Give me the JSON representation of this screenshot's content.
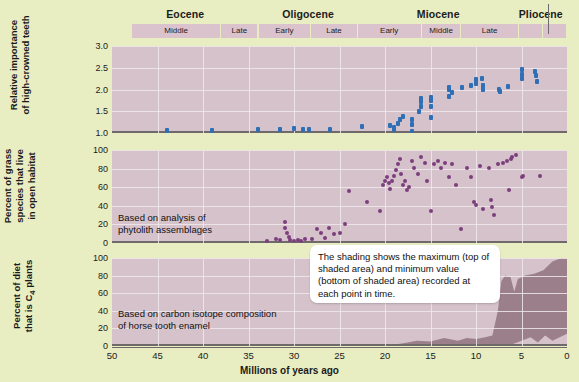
{
  "figure": {
    "background_color": "#e9edc2",
    "panel_color": "#d6c2ca",
    "gridline_color": "#efe9ec",
    "blue_marker_color": "#2f6fb5",
    "purple_marker_color": "#7b3f7e",
    "shading_color": "#9b7f8b"
  },
  "timescale": {
    "epochs": [
      {
        "label": "Eocene",
        "start_ma": 50,
        "end_ma": 33.9
      },
      {
        "label": "Oligocene",
        "start_ma": 33.9,
        "end_ma": 23.0
      },
      {
        "label": "Miocene",
        "start_ma": 23.0,
        "end_ma": 5.3
      },
      {
        "label": "Pliocene",
        "start_ma": 5.3,
        "end_ma": 2.6
      }
    ],
    "stages": [
      {
        "label": "Middle",
        "start_ma": 47.8,
        "end_ma": 38.0
      },
      {
        "label": "Late",
        "start_ma": 38.0,
        "end_ma": 33.9
      },
      {
        "label": "Early",
        "start_ma": 33.9,
        "end_ma": 28.1
      },
      {
        "label": "Late",
        "start_ma": 28.1,
        "end_ma": 23.0
      },
      {
        "label": "Early",
        "start_ma": 23.0,
        "end_ma": 15.97
      },
      {
        "label": "Middle",
        "start_ma": 15.97,
        "end_ma": 11.6
      },
      {
        "label": "Late",
        "start_ma": 11.6,
        "end_ma": 5.3
      },
      {
        "label": "",
        "start_ma": 5.3,
        "end_ma": 2.6
      },
      {
        "label": "",
        "start_ma": 2.6,
        "end_ma": 0
      }
    ]
  },
  "xaxis": {
    "title": "Millions of years ago",
    "ticks": [
      50,
      45,
      40,
      35,
      30,
      25,
      20,
      15,
      10,
      5,
      0
    ],
    "min": 0,
    "max": 50,
    "reversed": true
  },
  "chart_data": [
    {
      "type": "scatter",
      "panel": 1,
      "title": "",
      "ylabel": "Relative importance of high-crowned teeth",
      "xlabel": "Millions of years ago",
      "ylim": [
        1.0,
        3.0
      ],
      "yticks": [
        1.0,
        1.5,
        2.0,
        2.5,
        3.0
      ],
      "ytick_labels": [
        "1.0",
        "1.5",
        "2.0",
        "2.5",
        "3.0"
      ],
      "marker_color": "#2f6fb5",
      "points": [
        {
          "x": 44.0,
          "y": 1.05
        },
        {
          "x": 39.0,
          "y": 1.06
        },
        {
          "x": 34.0,
          "y": 1.07
        },
        {
          "x": 31.5,
          "y": 1.09
        },
        {
          "x": 30.0,
          "y": 1.1
        },
        {
          "x": 29.0,
          "y": 1.08
        },
        {
          "x": 28.3,
          "y": 1.09
        },
        {
          "x": 26.0,
          "y": 1.08
        },
        {
          "x": 22.5,
          "y": 1.16
        },
        {
          "x": 19.5,
          "y": 1.18
        },
        {
          "x": 19.0,
          "y": 1.12
        },
        {
          "x": 19.0,
          "y": 1.08
        },
        {
          "x": 18.6,
          "y": 1.22
        },
        {
          "x": 18.3,
          "y": 1.3
        },
        {
          "x": 18.0,
          "y": 1.38
        },
        {
          "x": 17.0,
          "y": 1.04
        },
        {
          "x": 17.0,
          "y": 1.2
        },
        {
          "x": 17.0,
          "y": 1.32
        },
        {
          "x": 16.3,
          "y": 1.5
        },
        {
          "x": 16.0,
          "y": 1.62
        },
        {
          "x": 16.0,
          "y": 1.72
        },
        {
          "x": 16.0,
          "y": 1.8
        },
        {
          "x": 15.0,
          "y": 1.35
        },
        {
          "x": 15.0,
          "y": 1.6
        },
        {
          "x": 15.0,
          "y": 1.74
        },
        {
          "x": 14.9,
          "y": 1.82
        },
        {
          "x": 13.0,
          "y": 1.85
        },
        {
          "x": 13.0,
          "y": 2.0
        },
        {
          "x": 13.0,
          "y": 2.05
        },
        {
          "x": 12.6,
          "y": 1.92
        },
        {
          "x": 11.5,
          "y": 2.05
        },
        {
          "x": 10.5,
          "y": 2.1
        },
        {
          "x": 10.0,
          "y": 2.22
        },
        {
          "x": 10.0,
          "y": 2.14
        },
        {
          "x": 9.3,
          "y": 2.25
        },
        {
          "x": 9.2,
          "y": 2.1
        },
        {
          "x": 9.2,
          "y": 2.0
        },
        {
          "x": 7.5,
          "y": 2.0
        },
        {
          "x": 7.4,
          "y": 1.96
        },
        {
          "x": 6.5,
          "y": 2.06
        },
        {
          "x": 5.0,
          "y": 2.45
        },
        {
          "x": 5.0,
          "y": 2.35
        },
        {
          "x": 5.0,
          "y": 2.25
        },
        {
          "x": 3.5,
          "y": 2.42
        },
        {
          "x": 3.4,
          "y": 2.32
        },
        {
          "x": 3.3,
          "y": 2.18
        }
      ]
    },
    {
      "type": "scatter",
      "panel": 2,
      "title": "",
      "ylabel": "Percent of grass species that live in open habitat",
      "xlabel": "Millions of years ago",
      "ylim": [
        0,
        100
      ],
      "yticks": [
        0,
        20,
        40,
        60,
        80,
        100
      ],
      "ytick_labels": [
        "0",
        "20",
        "40",
        "60",
        "80",
        "100"
      ],
      "marker_color": "#7b3f7e",
      "annotation": "Based on analysis of\nphytolith assemblages",
      "points": [
        {
          "x": 33.0,
          "y": 2
        },
        {
          "x": 32.0,
          "y": 4
        },
        {
          "x": 31.5,
          "y": 3
        },
        {
          "x": 31.0,
          "y": 22
        },
        {
          "x": 31.0,
          "y": 16
        },
        {
          "x": 30.8,
          "y": 10
        },
        {
          "x": 30.6,
          "y": 6
        },
        {
          "x": 30.4,
          "y": 3
        },
        {
          "x": 30.0,
          "y": 2
        },
        {
          "x": 29.6,
          "y": 3
        },
        {
          "x": 29.2,
          "y": 2
        },
        {
          "x": 28.8,
          "y": 4
        },
        {
          "x": 28.0,
          "y": 4
        },
        {
          "x": 27.5,
          "y": 14
        },
        {
          "x": 27.0,
          "y": 10
        },
        {
          "x": 26.6,
          "y": 5
        },
        {
          "x": 26.2,
          "y": 16
        },
        {
          "x": 25.6,
          "y": 9
        },
        {
          "x": 25.0,
          "y": 10
        },
        {
          "x": 24.4,
          "y": 20
        },
        {
          "x": 24.0,
          "y": 55
        },
        {
          "x": 22.0,
          "y": 44
        },
        {
          "x": 20.5,
          "y": 34
        },
        {
          "x": 20.2,
          "y": 62
        },
        {
          "x": 20.0,
          "y": 66
        },
        {
          "x": 19.8,
          "y": 70
        },
        {
          "x": 19.6,
          "y": 64
        },
        {
          "x": 19.4,
          "y": 58
        },
        {
          "x": 19.2,
          "y": 66
        },
        {
          "x": 19.0,
          "y": 72
        },
        {
          "x": 18.8,
          "y": 78
        },
        {
          "x": 18.6,
          "y": 84
        },
        {
          "x": 18.4,
          "y": 90
        },
        {
          "x": 18.2,
          "y": 74
        },
        {
          "x": 18.0,
          "y": 62
        },
        {
          "x": 17.8,
          "y": 66
        },
        {
          "x": 17.6,
          "y": 56
        },
        {
          "x": 17.4,
          "y": 60
        },
        {
          "x": 17.0,
          "y": 88
        },
        {
          "x": 16.8,
          "y": 80
        },
        {
          "x": 16.4,
          "y": 74
        },
        {
          "x": 16.0,
          "y": 92
        },
        {
          "x": 15.6,
          "y": 86
        },
        {
          "x": 15.4,
          "y": 66
        },
        {
          "x": 15.0,
          "y": 34
        },
        {
          "x": 14.6,
          "y": 84
        },
        {
          "x": 14.2,
          "y": 88
        },
        {
          "x": 13.8,
          "y": 80
        },
        {
          "x": 13.4,
          "y": 86
        },
        {
          "x": 13.0,
          "y": 70
        },
        {
          "x": 12.6,
          "y": 84
        },
        {
          "x": 12.2,
          "y": 62
        },
        {
          "x": 11.6,
          "y": 14
        },
        {
          "x": 11.0,
          "y": 80
        },
        {
          "x": 10.6,
          "y": 70
        },
        {
          "x": 10.2,
          "y": 44
        },
        {
          "x": 10.0,
          "y": 40
        },
        {
          "x": 9.6,
          "y": 82
        },
        {
          "x": 9.2,
          "y": 36
        },
        {
          "x": 8.6,
          "y": 80
        },
        {
          "x": 8.4,
          "y": 46
        },
        {
          "x": 8.2,
          "y": 38
        },
        {
          "x": 8.0,
          "y": 30
        },
        {
          "x": 7.6,
          "y": 84
        },
        {
          "x": 7.0,
          "y": 86
        },
        {
          "x": 6.6,
          "y": 88
        },
        {
          "x": 6.4,
          "y": 56
        },
        {
          "x": 6.2,
          "y": 90
        },
        {
          "x": 6.0,
          "y": 92
        },
        {
          "x": 5.6,
          "y": 94
        },
        {
          "x": 5.0,
          "y": 70
        },
        {
          "x": 4.8,
          "y": 72
        },
        {
          "x": 3.0,
          "y": 72
        }
      ]
    },
    {
      "type": "area",
      "panel": 3,
      "title": "",
      "ylabel": "Percent of diet that is C4 plants",
      "xlabel": "Millions of years ago",
      "ylim": [
        0,
        100
      ],
      "yticks": [
        0,
        20,
        40,
        60,
        80,
        100
      ],
      "ytick_labels": [
        "0",
        "20",
        "40",
        "60",
        "80",
        "100"
      ],
      "fill_color": "#9b7f8b",
      "annotation": "Based on carbon isotope composition\nof horse tooth enamel",
      "band_max": [
        {
          "x": 20.0,
          "y": 0
        },
        {
          "x": 18.0,
          "y": 3
        },
        {
          "x": 16.5,
          "y": 6
        },
        {
          "x": 15.0,
          "y": 5
        },
        {
          "x": 13.5,
          "y": 9
        },
        {
          "x": 12.0,
          "y": 6
        },
        {
          "x": 11.0,
          "y": 9
        },
        {
          "x": 10.0,
          "y": 8
        },
        {
          "x": 9.0,
          "y": 10
        },
        {
          "x": 8.2,
          "y": 12
        },
        {
          "x": 7.6,
          "y": 40
        },
        {
          "x": 7.2,
          "y": 74
        },
        {
          "x": 6.8,
          "y": 80
        },
        {
          "x": 6.2,
          "y": 78
        },
        {
          "x": 5.8,
          "y": 62
        },
        {
          "x": 5.4,
          "y": 76
        },
        {
          "x": 4.6,
          "y": 80
        },
        {
          "x": 3.6,
          "y": 82
        },
        {
          "x": 2.6,
          "y": 86
        },
        {
          "x": 1.6,
          "y": 96
        },
        {
          "x": 0.6,
          "y": 100
        },
        {
          "x": 0.0,
          "y": 100
        }
      ],
      "band_min": [
        {
          "x": 20.0,
          "y": 0
        },
        {
          "x": 16.0,
          "y": 0
        },
        {
          "x": 12.0,
          "y": 0
        },
        {
          "x": 9.0,
          "y": 0
        },
        {
          "x": 7.5,
          "y": 0
        },
        {
          "x": 6.0,
          "y": 2
        },
        {
          "x": 5.0,
          "y": 6
        },
        {
          "x": 4.0,
          "y": 10
        },
        {
          "x": 3.2,
          "y": 4
        },
        {
          "x": 2.4,
          "y": 12
        },
        {
          "x": 1.6,
          "y": 6
        },
        {
          "x": 0.8,
          "y": 10
        },
        {
          "x": 0.0,
          "y": 14
        }
      ]
    }
  ],
  "callout": {
    "text": "The shading shows the maximum (top of shaded area) and minimum value (bottom of shaded area) recorded at each point in time."
  }
}
